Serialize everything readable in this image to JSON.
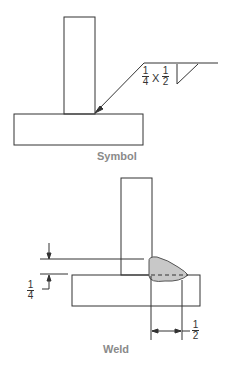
{
  "symbol": {
    "caption": "Symbol",
    "size1": {
      "num": "1",
      "den": "4"
    },
    "times": "X",
    "size2": {
      "num": "1",
      "den": "2"
    }
  },
  "weld": {
    "caption": "Weld",
    "vertical_dim": {
      "num": "1",
      "den": "4"
    },
    "horizontal_dim": {
      "num": "1",
      "den": "2"
    },
    "fill_color": "#c8c8c8"
  }
}
